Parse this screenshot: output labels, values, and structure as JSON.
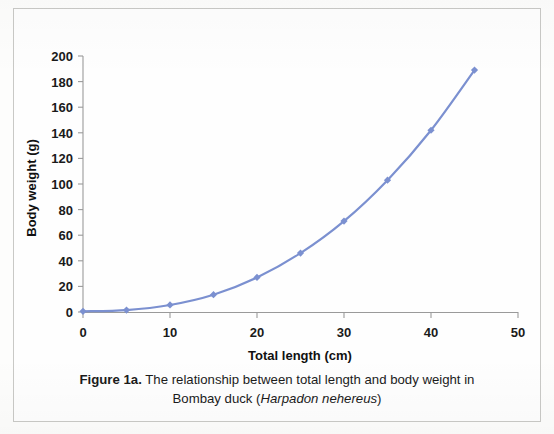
{
  "figure": {
    "caption_label": "Figure 1a.",
    "caption_line1": "The relationship between total length and body weight in",
    "caption_line2_prefix": "Bombay duck (",
    "caption_species": "Harpadon nehereus",
    "caption_line2_suffix": ")"
  },
  "chart_data": {
    "type": "line",
    "title": "",
    "xlabel": "Total length (cm)",
    "ylabel": "Body weight (g)",
    "xlim": [
      0,
      50
    ],
    "ylim": [
      0,
      200
    ],
    "xticks": [
      0,
      10,
      20,
      30,
      40,
      50
    ],
    "yticks": [
      0,
      20,
      40,
      60,
      80,
      100,
      120,
      140,
      160,
      180,
      200
    ],
    "grid": false,
    "legend": false,
    "series": [
      {
        "name": "Body weight",
        "color": "#7b90d0",
        "marker": "diamond",
        "x": [
          0,
          5,
          10,
          15,
          20,
          25,
          30,
          35,
          40,
          45
        ],
        "values": [
          0.5,
          1.5,
          5.5,
          13.5,
          27,
          46,
          71,
          103,
          142,
          189
        ]
      }
    ]
  },
  "axes": {
    "x_tick_labels": [
      "0",
      "10",
      "20",
      "30",
      "40",
      "50"
    ],
    "y_tick_labels": [
      "0",
      "20",
      "40",
      "60",
      "80",
      "100",
      "120",
      "140",
      "160",
      "180",
      "200"
    ],
    "x_axis_title": "Total length (cm)",
    "y_axis_title": "Body weight (g)"
  }
}
